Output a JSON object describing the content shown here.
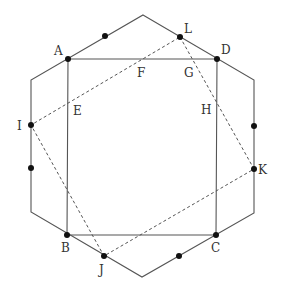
{
  "figure": {
    "colors": {
      "line": "#555555",
      "dashed": "#555555",
      "point": "#111111"
    },
    "labels": {
      "A": "A",
      "B": "B",
      "C": "C",
      "D": "D",
      "E": "E",
      "F": "F",
      "G": "G",
      "H": "H",
      "I": "I",
      "J": "J",
      "K": "K",
      "L": "L"
    },
    "hexagon": [
      [
        143,
        15
      ],
      [
        254,
        80
      ],
      [
        254,
        213
      ],
      [
        142,
        277
      ],
      [
        31,
        212
      ],
      [
        31,
        80
      ]
    ],
    "square": {
      "A": [
        68,
        59
      ],
      "D": [
        217,
        59
      ],
      "C": [
        216,
        235
      ],
      "B": [
        67,
        235
      ]
    },
    "dashed_quad": {
      "L": [
        180,
        37
      ],
      "K": [
        254,
        169
      ],
      "J": [
        104,
        256
      ],
      "I": [
        31,
        125
      ]
    },
    "extra_points": [
      [
        105,
        36
      ],
      [
        254,
        126
      ],
      [
        179,
        256
      ],
      [
        31,
        168
      ]
    ]
  }
}
